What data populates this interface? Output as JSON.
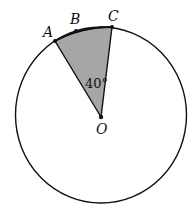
{
  "diagram": {
    "type": "circle-sector",
    "points": {
      "A": {
        "label": "A"
      },
      "B": {
        "label": "B"
      },
      "C": {
        "label": "C"
      },
      "O": {
        "label": "O"
      }
    },
    "angle_label": "40°",
    "colors": {
      "stroke": "#111111",
      "sector_fill": "#a6a6a6",
      "background": "#ffffff"
    }
  }
}
